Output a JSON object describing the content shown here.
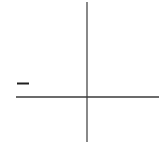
{
  "diagram": {
    "type": "coordinate-axes",
    "colors": {
      "background": "#ffffff",
      "axis": "#3a3a3a",
      "tick": "#1e1e1e"
    },
    "x_axis": {
      "x1": 16,
      "y1": 97,
      "x2": 159,
      "y2": 97,
      "stroke_width": 1.5
    },
    "y_axis": {
      "x1": 87,
      "y1": 2,
      "x2": 87,
      "y2": 142,
      "stroke_width": 1.2
    },
    "marks": [
      {
        "name": "tick-mark",
        "x1": 17,
        "y1": 83.5,
        "x2": 29,
        "y2": 83.5,
        "stroke_width": 2
      }
    ]
  }
}
